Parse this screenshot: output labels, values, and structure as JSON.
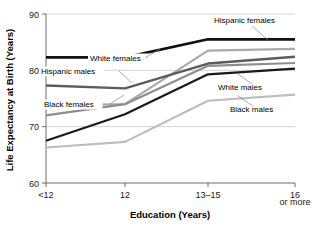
{
  "chart_data": {
    "type": "line",
    "title": "",
    "xlabel": "Education (Years)",
    "ylabel": "Life Expectancy at Birth (Years)",
    "categories": [
      "<12",
      "12",
      "13–15",
      "16"
    ],
    "x_tick_sublabel": "or more",
    "ylim": [
      60,
      90
    ],
    "y_ticks": [
      60,
      70,
      80,
      90
    ],
    "grid": "horizontal",
    "legend": "inline-annotations",
    "series": [
      {
        "name": "Hispanic females",
        "color": "#111111",
        "width": 2.6,
        "values": [
          82.3,
          82.3,
          85.5,
          85.5
        ]
      },
      {
        "name": "White females",
        "color": "#aaaaaa",
        "width": 2.2,
        "values": [
          73.8,
          74.0,
          83.5,
          83.8
        ]
      },
      {
        "name": "Hispanic males",
        "color": "#5c5c5c",
        "width": 2.4,
        "values": [
          77.3,
          76.8,
          81.2,
          82.4
        ]
      },
      {
        "name": "Black females",
        "color": "#8e8e8e",
        "width": 2.2,
        "values": [
          72.0,
          74.0,
          80.8,
          81.3
        ]
      },
      {
        "name": "White males",
        "color": "#1a1a1a",
        "width": 2.2,
        "values": [
          67.5,
          72.2,
          79.3,
          80.3
        ]
      },
      {
        "name": "Black males",
        "color": "#bdbdbd",
        "width": 2.2,
        "values": [
          66.3,
          67.3,
          74.6,
          75.7
        ]
      }
    ],
    "annotations": [
      {
        "text": "Hispanic females",
        "x": 214,
        "y": 23
      },
      {
        "text": "White females",
        "x": 90,
        "y": 61
      },
      {
        "text": "Hispanic males",
        "x": 41,
        "y": 74
      },
      {
        "text": "Black females",
        "x": 44,
        "y": 107
      },
      {
        "text": "White males",
        "x": 218,
        "y": 90
      },
      {
        "text": "Black males",
        "x": 230,
        "y": 112
      }
    ]
  }
}
